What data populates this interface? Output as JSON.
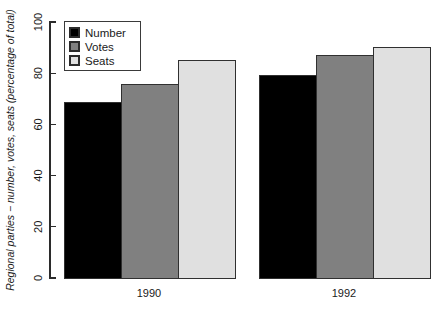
{
  "chart_data": {
    "type": "bar",
    "title": "",
    "subtitle": "",
    "xlabel": "",
    "ylabel": "Regional parties − number, votes, seats (percentage of total)",
    "categories": [
      "1990",
      "1992"
    ],
    "series": [
      {
        "name": "Number",
        "values": [
          68.7,
          79.0
        ],
        "color": "#000000"
      },
      {
        "name": "Votes",
        "values": [
          75.7,
          87.0
        ],
        "color": "#808080"
      },
      {
        "name": "Seats",
        "values": [
          85.0,
          90.0
        ],
        "color": "#e0e0e0"
      }
    ],
    "ylim": [
      0,
      100
    ],
    "yticks": [
      0,
      20,
      40,
      60,
      80,
      100
    ],
    "ytick_labels": [
      "0",
      "20",
      "40",
      "60",
      "80",
      "100"
    ],
    "grid": false,
    "legend_position": "top-left",
    "legend_entries": [
      "Number",
      "Votes",
      "Seats"
    ],
    "bar_border_color": "#303030",
    "axis_color": "#2b2b2b",
    "background": "#ffffff"
  },
  "axis": {
    "y_title": "Regional parties − number, votes, seats (percentage of total)",
    "ticks": [
      "0",
      "20",
      "40",
      "60",
      "80",
      "100"
    ]
  },
  "legend": {
    "items": [
      {
        "label": "Number",
        "color": "#000000"
      },
      {
        "label": "Votes",
        "color": "#808080"
      },
      {
        "label": "Seats",
        "color": "#e0e0e0"
      }
    ]
  },
  "categories": [
    {
      "label": "1990"
    },
    {
      "label": "1992"
    }
  ]
}
